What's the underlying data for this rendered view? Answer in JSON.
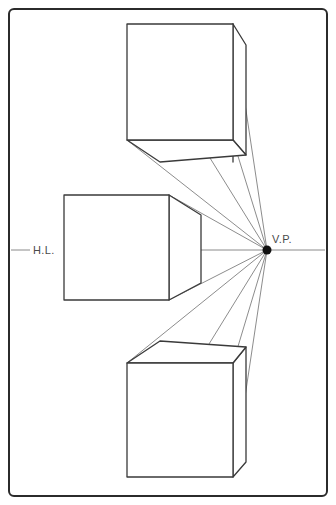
{
  "canvas": {
    "width": 336,
    "height": 505,
    "background": "#ffffff"
  },
  "frame": {
    "name": "drawing-border",
    "x": 9,
    "y": 9,
    "width": 318,
    "height": 487,
    "radius": 5,
    "stroke": "#2b2b2b",
    "stroke_width": 2
  },
  "labels": {
    "horizon_line": "H.L.",
    "vanishing_point": "V.P."
  },
  "colors": {
    "box_stroke": "#3a3a3a",
    "guide_stroke": "#6e6e6e",
    "horizon_stroke": "#8a8a8a",
    "vp_fill": "#111111",
    "label_text": "#4a4a4a",
    "frame_stroke": "#2b2b2b",
    "background": "#ffffff"
  },
  "horizon": {
    "name": "horizon-line",
    "y": 250,
    "x_start": 11,
    "x_end": 325,
    "label_x": 46,
    "label_y": 253,
    "gap_start": 30,
    "gap_end": 64
  },
  "vanishing_point": {
    "name": "vanishing-point",
    "x": 267,
    "y": 250,
    "radius": 4.5,
    "label_x": 272,
    "label_y": 243
  },
  "boxes": [
    {
      "name": "upper-box",
      "position": "above-horizon",
      "front_face": {
        "left": 127,
        "top": 24,
        "right": 233,
        "bottom": 140
      },
      "back_face": {
        "left": 199,
        "top": 42,
        "right": 233,
        "bottom": 162
      },
      "visible_faces": [
        "front",
        "right",
        "bottom"
      ]
    },
    {
      "name": "middle-box",
      "position": "on-horizon",
      "front_face": {
        "left": 64,
        "top": 195,
        "right": 169,
        "bottom": 300
      },
      "back_face": {
        "left": 201,
        "top": 215,
        "right": 201,
        "bottom": 283
      },
      "visible_faces": [
        "front",
        "right"
      ]
    },
    {
      "name": "lower-box",
      "position": "below-horizon",
      "front_face": {
        "left": 127,
        "top": 363,
        "right": 233,
        "bottom": 477
      },
      "back_face": {
        "left": 199,
        "top": 341,
        "right": 233,
        "bottom": 462
      },
      "visible_faces": [
        "front",
        "right",
        "top"
      ]
    }
  ],
  "guide_lines": [
    {
      "name": "guide-upper-top-left",
      "x1": 127,
      "y1": 24,
      "x2": 267,
      "y2": 250
    },
    {
      "name": "guide-upper-top-right",
      "x1": 233,
      "y1": 24,
      "x2": 267,
      "y2": 250
    },
    {
      "name": "guide-upper-bot-left",
      "x1": 127,
      "y1": 140,
      "x2": 267,
      "y2": 250
    },
    {
      "name": "guide-upper-bot-right",
      "x1": 233,
      "y1": 140,
      "x2": 267,
      "y2": 250
    },
    {
      "name": "guide-middle-top-right",
      "x1": 169,
      "y1": 195,
      "x2": 267,
      "y2": 250
    },
    {
      "name": "guide-middle-bot-right",
      "x1": 169,
      "y1": 300,
      "x2": 267,
      "y2": 250
    },
    {
      "name": "guide-lower-top-left",
      "x1": 127,
      "y1": 363,
      "x2": 267,
      "y2": 250
    },
    {
      "name": "guide-lower-top-right",
      "x1": 233,
      "y1": 363,
      "x2": 267,
      "y2": 250
    },
    {
      "name": "guide-lower-bot-left",
      "x1": 127,
      "y1": 477,
      "x2": 267,
      "y2": 250
    },
    {
      "name": "guide-lower-bot-right",
      "x1": 233,
      "y1": 477,
      "x2": 267,
      "y2": 250
    }
  ]
}
